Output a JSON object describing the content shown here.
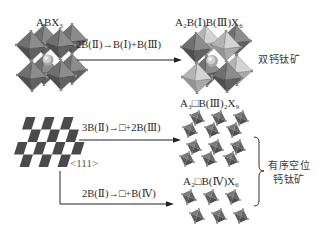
{
  "figure": {
    "top": {
      "source_label": "ABX₃",
      "reaction": "2B(Ⅱ)→B(Ⅰ)+B(Ⅲ)",
      "product_label": "A₂B(Ⅰ)B(Ⅲ)X₆",
      "category": "双钙钛矿"
    },
    "bottom": {
      "direction_label": "<111>",
      "branch_1": {
        "reaction": "3B(Ⅱ)→□+2B(Ⅲ)",
        "product_label": "A₃□B(Ⅲ)₂X₉"
      },
      "branch_2": {
        "reaction": "2B(Ⅱ)→□+B(Ⅳ)",
        "product_label": "A₂□B(Ⅳ)X₆"
      },
      "category_line_1": "有序空位",
      "category_line_2": "钙钛矿"
    }
  },
  "colors": {
    "background": "#ffffff",
    "text": "#2a2a2a",
    "arrow": "#222222",
    "octahedron_dark": "#5e5e5e",
    "octahedron_light": "#b8b8b8",
    "checkerboard": "#4a4a4a"
  }
}
